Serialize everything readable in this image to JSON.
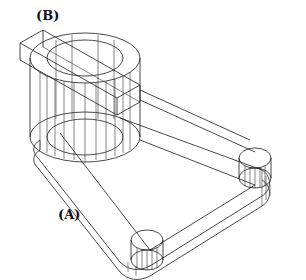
{
  "figure": {
    "labels": {
      "a": "(A)",
      "b": "(B)"
    },
    "colors": {
      "line": "#1a1a1a",
      "background": "#ffffff"
    }
  }
}
